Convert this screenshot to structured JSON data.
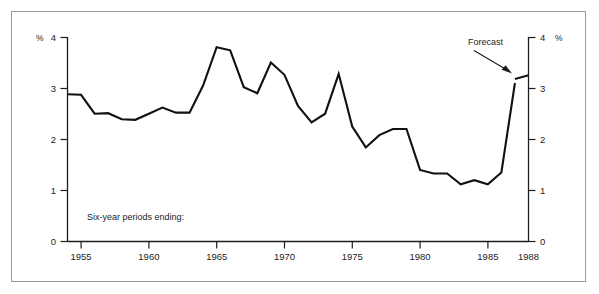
{
  "figure": {
    "top_clipped_caption": "",
    "note": "Six-year periods ending:",
    "annotation": "Forecast",
    "left_unit": "%",
    "right_unit": "%"
  },
  "chart_data": {
    "type": "line",
    "title": "",
    "subtitle": "",
    "xlabel": "",
    "ylabel": "%",
    "y2label": "%",
    "xlim": [
      1954,
      1988
    ],
    "ylim": [
      0,
      4
    ],
    "grid": false,
    "legend": null,
    "x_tick_labels": [
      "1955",
      "1960",
      "1965",
      "1970",
      "1975",
      "1980",
      "1985",
      "1988"
    ],
    "x_ticks": [
      1955,
      1960,
      1965,
      1970,
      1975,
      1980,
      1985,
      1988
    ],
    "y_tick_labels": [
      "0",
      "1",
      "2",
      "3",
      "4"
    ],
    "y_ticks": [
      0,
      1,
      2,
      3,
      4
    ],
    "y2_tick_labels": [
      "0",
      "1",
      "2",
      "3",
      "4"
    ],
    "y2_ticks": [
      0,
      1,
      2,
      3,
      4
    ],
    "annotations": [
      {
        "text": "Forecast",
        "x": 1987.0,
        "y": 3.55,
        "points_to_x": 1987.4,
        "points_to_y": 3.25
      },
      {
        "text": "Six-year periods ending:",
        "x": 1955.6,
        "y": 0.42,
        "points_to_x": null,
        "points_to_y": null
      }
    ],
    "series": [
      {
        "name": "Six-year average growth rate",
        "style": "solid",
        "color": "#111111",
        "x": [
          1954,
          1955,
          1956,
          1957,
          1958,
          1959,
          1960,
          1961,
          1962,
          1963,
          1964,
          1965,
          1966,
          1967,
          1968,
          1969,
          1970,
          1971,
          1972,
          1973,
          1974,
          1975,
          1976,
          1977,
          1978,
          1979,
          1980,
          1981,
          1982,
          1983,
          1984,
          1985,
          1986,
          1987
        ],
        "values": [
          2.88,
          2.87,
          2.5,
          2.51,
          2.39,
          2.38,
          2.5,
          2.62,
          2.52,
          2.52,
          3.05,
          3.8,
          3.74,
          3.02,
          2.9,
          3.5,
          3.26,
          2.65,
          2.33,
          2.5,
          3.28,
          2.25,
          1.84,
          2.08,
          2.2,
          2.2,
          1.4,
          1.33,
          1.33,
          1.12,
          1.2,
          1.12,
          1.35,
          3.1
        ]
      },
      {
        "name": "Forecast",
        "style": "solid",
        "color": "#111111",
        "x": [
          1987,
          1988
        ],
        "values": [
          3.18,
          3.25
        ]
      }
    ]
  }
}
